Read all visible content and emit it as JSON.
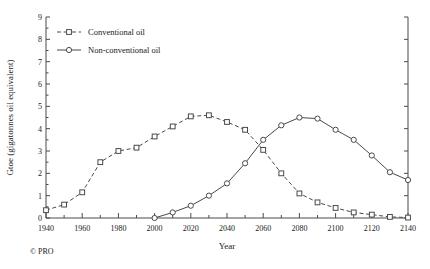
{
  "credit": "© PRO",
  "chart_data": {
    "type": "line",
    "title": "",
    "xlabel": "Year",
    "ylabel": "Gtoe (gigatonnes oil equivalent)",
    "xlim": [
      1940,
      2140
    ],
    "ylim": [
      0,
      9
    ],
    "xticks": [
      1940,
      1960,
      1980,
      2000,
      2020,
      2040,
      2060,
      2080,
      2100,
      2120,
      2140
    ],
    "xticklabels": [
      "1940",
      "1960",
      "1980",
      "2000",
      "2020",
      "2040",
      "2060",
      "2080",
      "2100",
      "2120",
      "2140"
    ],
    "xminor_step": 10,
    "yticks": [
      0,
      1,
      2,
      3,
      4,
      5,
      6,
      7,
      8,
      9
    ],
    "yticklabels": [
      "0",
      "1",
      "2",
      "3",
      "4",
      "5",
      "6",
      "7",
      "8",
      "9"
    ],
    "grid": false,
    "legend_position": "upper left",
    "series": [
      {
        "name": "Conventional oil",
        "marker": "square",
        "linestyle": "dashed",
        "color": "#4a4a4a",
        "x": [
          1940,
          1950,
          1960,
          1970,
          1980,
          1990,
          2000,
          2010,
          2020,
          2030,
          2040,
          2050,
          2060,
          2070,
          2080,
          2090,
          2100,
          2110,
          2120,
          2130,
          2140
        ],
        "values": [
          0.35,
          0.6,
          1.15,
          2.5,
          3.0,
          3.15,
          3.65,
          4.1,
          4.55,
          4.6,
          4.3,
          3.95,
          3.05,
          2.0,
          1.1,
          0.7,
          0.45,
          0.25,
          0.15,
          0.05,
          0.02
        ]
      },
      {
        "name": "Non-conventional oil",
        "marker": "circle",
        "linestyle": "solid",
        "color": "#4a4a4a",
        "x": [
          2000,
          2010,
          2020,
          2030,
          2040,
          2050,
          2060,
          2070,
          2080,
          2090,
          2100,
          2110,
          2120,
          2130,
          2140
        ],
        "values": [
          0.0,
          0.25,
          0.55,
          1.0,
          1.55,
          2.45,
          3.5,
          4.15,
          4.5,
          4.45,
          3.95,
          3.5,
          2.8,
          2.05,
          1.7
        ]
      }
    ]
  }
}
